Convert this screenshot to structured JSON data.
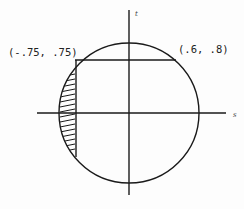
{
  "diagram": {
    "axes": {
      "horizontal_label": "s",
      "vertical_label": "t"
    },
    "points": [
      {
        "label": "(-.75, .75)",
        "x": -0.75,
        "y": 0.75
      },
      {
        "label": "(.6, .8)",
        "x": 0.6,
        "y": 0.8
      }
    ],
    "shape": "unit circle",
    "shaded_region": "circular segment left of s = -.75",
    "colors": {
      "line": "#1a1a1a",
      "background": "#fdfdfd"
    }
  }
}
